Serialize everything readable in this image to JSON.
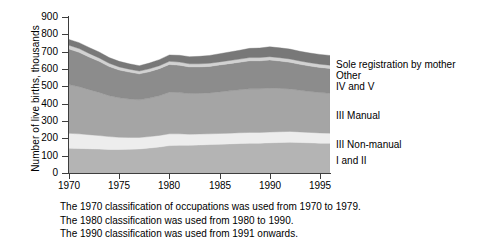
{
  "chart_data": {
    "type": "area",
    "stacked": true,
    "title": "",
    "xlabel": "",
    "ylabel": "Number of live births, thousands",
    "xlim": [
      1970,
      1996
    ],
    "ylim": [
      0,
      900
    ],
    "ytick_labels": [
      "0",
      "100",
      "200",
      "300",
      "400",
      "500",
      "600",
      "700",
      "800",
      "900"
    ],
    "ytick_values": [
      0,
      100,
      200,
      300,
      400,
      500,
      600,
      700,
      800,
      900
    ],
    "xtick_labels": [
      "1970",
      "1975",
      "1980",
      "1985",
      "1990",
      "1995"
    ],
    "xtick_values": [
      1970,
      1975,
      1980,
      1985,
      1990,
      1995
    ],
    "grid": false,
    "legend_position": "right-outside",
    "x": [
      1970,
      1971,
      1972,
      1973,
      1974,
      1975,
      1976,
      1977,
      1978,
      1979,
      1980,
      1981,
      1982,
      1983,
      1984,
      1985,
      1986,
      1987,
      1988,
      1989,
      1990,
      1991,
      1992,
      1993,
      1994,
      1995,
      1996
    ],
    "series": [
      {
        "name": "I and II",
        "color": "#b4b4b4",
        "values": [
          143,
          142,
          140,
          138,
          136,
          136,
          137,
          139,
          144,
          150,
          158,
          160,
          160,
          162,
          164,
          166,
          168,
          170,
          172,
          172,
          174,
          176,
          178,
          176,
          174,
          172,
          172
        ]
      },
      {
        "name": "III Non-manual",
        "color": "#ededed",
        "values": [
          86,
          84,
          81,
          78,
          74,
          70,
          68,
          66,
          66,
          67,
          68,
          66,
          64,
          63,
          62,
          62,
          62,
          62,
          62,
          62,
          62,
          62,
          62,
          61,
          60,
          59,
          58
        ]
      },
      {
        "name": "III Manual",
        "color": "#a5a5a5",
        "values": [
          281,
          272,
          260,
          249,
          236,
          228,
          222,
          217,
          222,
          229,
          240,
          238,
          234,
          234,
          236,
          240,
          244,
          248,
          252,
          252,
          254,
          250,
          245,
          240,
          236,
          233,
          230
        ]
      },
      {
        "name": "IV and V",
        "color": "#8c8c8c",
        "values": [
          205,
          198,
          188,
          179,
          168,
          160,
          155,
          150,
          152,
          156,
          160,
          158,
          154,
          153,
          153,
          155,
          157,
          159,
          161,
          161,
          162,
          158,
          154,
          150,
          147,
          145,
          143
        ]
      },
      {
        "name": "Other",
        "color": "#d2d2d2",
        "values": [
          22,
          22,
          21,
          20,
          19,
          18,
          17,
          16,
          17,
          17,
          18,
          18,
          18,
          18,
          18,
          18,
          18,
          18,
          19,
          19,
          19,
          19,
          19,
          19,
          19,
          19,
          19
        ]
      },
      {
        "name": "Sole registration by mother",
        "color": "#787878",
        "values": [
          33,
          34,
          34,
          34,
          33,
          32,
          31,
          31,
          33,
          35,
          37,
          39,
          41,
          43,
          45,
          47,
          49,
          51,
          53,
          55,
          57,
          57,
          57,
          56,
          56,
          56,
          56
        ]
      }
    ],
    "totals": [
      770,
      752,
      724,
      698,
      666,
      644,
      630,
      619,
      634,
      654,
      681,
      679,
      671,
      673,
      678,
      688,
      698,
      708,
      719,
      721,
      728,
      722,
      715,
      702,
      692,
      684,
      678
    ]
  },
  "legend": {
    "items": [
      {
        "label": "Sole registration by mother"
      },
      {
        "label": "Other"
      },
      {
        "label": "IV and V"
      },
      {
        "label": "III Manual"
      },
      {
        "label": "III Non-manual"
      },
      {
        "label": "I and II"
      }
    ]
  },
  "notes": [
    "The 1970 classification of occupations was used from 1970 to 1979.",
    "The 1980 classification was used from 1980 to 1990.",
    "The 1990 classification was used from 1991 onwards."
  ]
}
